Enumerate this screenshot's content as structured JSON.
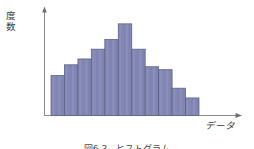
{
  "figure": {
    "background_color": "#ffffff",
    "axis_color": "#8b8b8b",
    "y_axis_label": "度数",
    "y_axis_label_chars": [
      "度",
      "数"
    ],
    "x_axis_label": "データ",
    "caption": "図6.3　ヒストグラム",
    "caption_visible": "partially clipped at bottom edge"
  },
  "chart_data": {
    "type": "bar",
    "title": "",
    "subtitle": "",
    "xlabel": "データ",
    "ylabel": "度数",
    "categories": [
      "1",
      "2",
      "3",
      "4",
      "5",
      "6",
      "7",
      "8",
      "9",
      "10",
      "11"
    ],
    "values": [
      41,
      52,
      58,
      68,
      78,
      94,
      68,
      50,
      47,
      28,
      18
    ],
    "ylim": [
      0,
      100
    ],
    "grid": false,
    "legend": false,
    "legend_position": "none",
    "bar_count": 11,
    "bar_fill_color": "#8287b5",
    "bar_stroke_color": "#5f6384",
    "tick_labels_x": [],
    "tick_labels_y": [],
    "annotations": [],
    "shape_note": "unimodal bell-shaped distribution, peak at 6th bar, right skew"
  }
}
